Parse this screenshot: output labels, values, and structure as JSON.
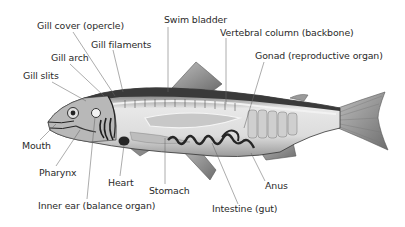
{
  "diagram": {
    "colors": {
      "background": "#ffffff",
      "label_text": "#2a2a2a",
      "leader_line": "#555555",
      "body_light": "#e6e6e6",
      "body_mid": "#a8a8a8",
      "body_dark": "#3a3a3a",
      "organ_dark": "#262626"
    },
    "labels": [
      {
        "id": "gill-cover",
        "text": "Gill cover (opercle)",
        "x": 37,
        "y": 20
      },
      {
        "id": "gill-filaments",
        "text": "Gill filaments",
        "x": 91,
        "y": 39
      },
      {
        "id": "gill-arch",
        "text": "Gill arch",
        "x": 51,
        "y": 52
      },
      {
        "id": "gill-slits",
        "text": "Gill slits",
        "x": 23,
        "y": 70
      },
      {
        "id": "swim-bladder",
        "text": "Swim bladder",
        "x": 164,
        "y": 14
      },
      {
        "id": "vertebral-column",
        "text": "Vertebral column (backbone)",
        "x": 220,
        "y": 27
      },
      {
        "id": "gonad",
        "text": "Gonad (reproductive organ)",
        "x": 255,
        "y": 50
      },
      {
        "id": "mouth",
        "text": "Mouth",
        "x": 22,
        "y": 140
      },
      {
        "id": "pharynx",
        "text": "Pharynx",
        "x": 39,
        "y": 167
      },
      {
        "id": "heart",
        "text": "Heart",
        "x": 108,
        "y": 177
      },
      {
        "id": "stomach",
        "text": "Stomach",
        "x": 149,
        "y": 185
      },
      {
        "id": "inner-ear",
        "text": "Inner ear (balance organ)",
        "x": 38,
        "y": 200
      },
      {
        "id": "anus",
        "text": "Anus",
        "x": 265,
        "y": 180
      },
      {
        "id": "intestine",
        "text": "Intestine (gut)",
        "x": 212,
        "y": 203
      }
    ]
  }
}
